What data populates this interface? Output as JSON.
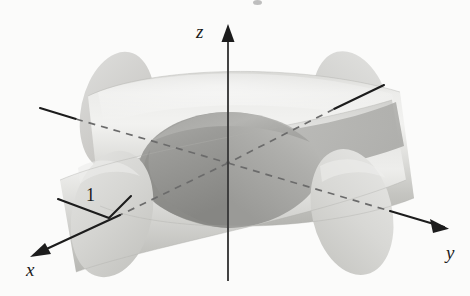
{
  "figure": {
    "kind": "3d-geometry-diagram",
    "background_color": "#fbfbfa",
    "axes": [
      {
        "id": "z",
        "label": "z",
        "direction": "up",
        "arrow": true
      },
      {
        "id": "y",
        "label": "y",
        "direction": "lower-right",
        "arrow": true
      },
      {
        "id": "x",
        "label": "x",
        "direction": "lower-left",
        "arrow": true
      }
    ],
    "annotations": [
      {
        "id": "radius",
        "label": "1",
        "meaning": "cylinder radius"
      }
    ],
    "colors": {
      "stroke": "#1c1c1c",
      "cylinder_light": "#e9e9e7",
      "cylinder_mid": "#d2d2cf",
      "cylinder_shade": "#bcbcb8",
      "intersection_dark": "#9a9a97",
      "intersection_darker": "#8a8a87",
      "cap_light": "#dedede",
      "cap_shade": "#c6c6c3"
    }
  },
  "geometry": {
    "origin": {
      "x": 228,
      "y": 163
    },
    "cylinder_radius_px": 74,
    "z_axis": {
      "x1": 228,
      "y1": 30,
      "x2": 228,
      "y2": 281
    },
    "y_axis": {
      "x1": 40,
      "y1": 108,
      "x2": 449,
      "y2": 228
    },
    "x_axis": {
      "x1": 384,
      "y1": 85,
      "x2": 33,
      "y2": 253
    },
    "radius_marker": {
      "points": "58,199 109,218 131,196"
    }
  }
}
